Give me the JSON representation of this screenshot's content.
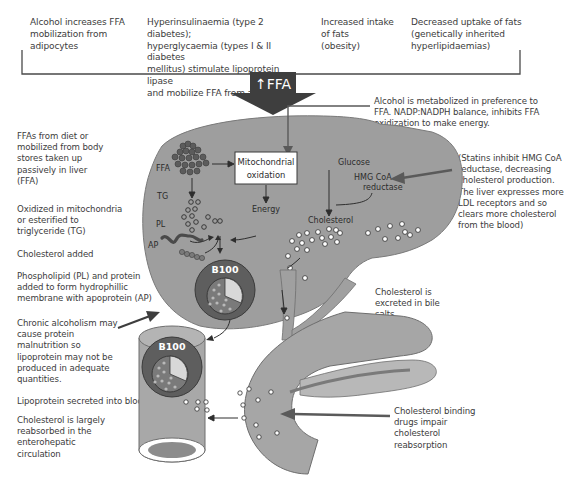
{
  "top_causes": [
    {
      "id": "alcohol",
      "text": "Alcohol increases FFA mobilization from adipocytes",
      "lines": [
        "Alcohol increases FFA",
        "mobilization from",
        "adipocytes"
      ]
    },
    {
      "id": "hyperinsulinaemia",
      "lines": [
        "Hyperinsulinaemia (type 2 diabetes);",
        "hyperglycaemia (types I & II diabetes",
        "mellitus) stimulate lipoprotein lipase",
        "and mobilize FFA from adipocytes"
      ]
    },
    {
      "id": "intake",
      "lines": [
        "Increased intake",
        "of fats",
        "(obesity)"
      ]
    },
    {
      "id": "uptake",
      "lines": [
        "Decreased uptake of fats",
        "(genetically inherited",
        "hyperlipidaemias)"
      ]
    }
  ],
  "main_arrow": {
    "label": "↑FFA"
  },
  "alcohol_note": {
    "lines": [
      "Alcohol  is metabolized in  preference to",
      "FFA. NADP:NADPH balance, inhibits FFA",
      "oxidization to make energy."
    ]
  },
  "left_notes": [
    {
      "id": "ffa-uptake",
      "lines": [
        "FFAs from diet or",
        "mobilized from body",
        "stores taken up",
        "passively in liver",
        "(FFA)"
      ]
    },
    {
      "id": "oxidized",
      "lines": [
        "Oxidized in mitochondria",
        "or esterified to",
        "triglyceride (TG)"
      ]
    },
    {
      "id": "cholesterol-added",
      "lines": [
        "Cholesterol added"
      ]
    },
    {
      "id": "phospholipid",
      "lines": [
        "Phospholipid (PL) and protein",
        "added to form hydrophillic",
        "membrane with apoprotein (AP)"
      ]
    },
    {
      "id": "chronic-alcoholism",
      "lines": [
        "Chronic alcoholism may",
        "cause protein",
        "malnutrition so",
        "lipoprotein may not be",
        "produced in adequate",
        "quantities."
      ]
    },
    {
      "id": "secreted",
      "lines": [
        "Lipoprotein secreted into blood"
      ]
    },
    {
      "id": "reabsorbed",
      "lines": [
        "Cholesterol is largely",
        "reabsorbed in  the",
        "enterohepatic",
        "circulation"
      ]
    }
  ],
  "right_notes": [
    {
      "id": "statins",
      "lines": [
        "(Statins inhibit HMG CoA",
        "reductase, decreasing",
        "cholesterol production.",
        "The liver expresses more",
        "LDL receptors and so",
        "clears more cholesterol",
        "from the blood)"
      ]
    },
    {
      "id": "bile",
      "lines": [
        "Cholesterol is",
        "excreted in bile",
        "salts"
      ]
    },
    {
      "id": "binding-drugs",
      "lines": [
        "Cholesterol binding",
        "drugs impair",
        "cholesterol",
        "reabsorption"
      ]
    }
  ],
  "diagram_labels": {
    "ffa": "FFA",
    "tg": "TG",
    "pl": "PL",
    "ap": "AP",
    "mito_line1": "Mitochondrial",
    "mito_line2": "oxidation",
    "energy": "Energy",
    "glucose": "Glucose",
    "hmg_line1": "HMG CoA",
    "hmg_line2": "reductase",
    "cholesterol": "Cholesterol",
    "b100_liver": "B100",
    "b100_vessel": "B100"
  },
  "colors": {
    "liver": "#9a9a9a",
    "liver_dark": "#7a7a7a",
    "vessel": "#a6a6a6",
    "lipoprotein_outer": "#5e5e5e",
    "lipoprotein_core": "#8a8a8a",
    "arrow": "#6b6b6b",
    "text": "#3c3c3c"
  }
}
